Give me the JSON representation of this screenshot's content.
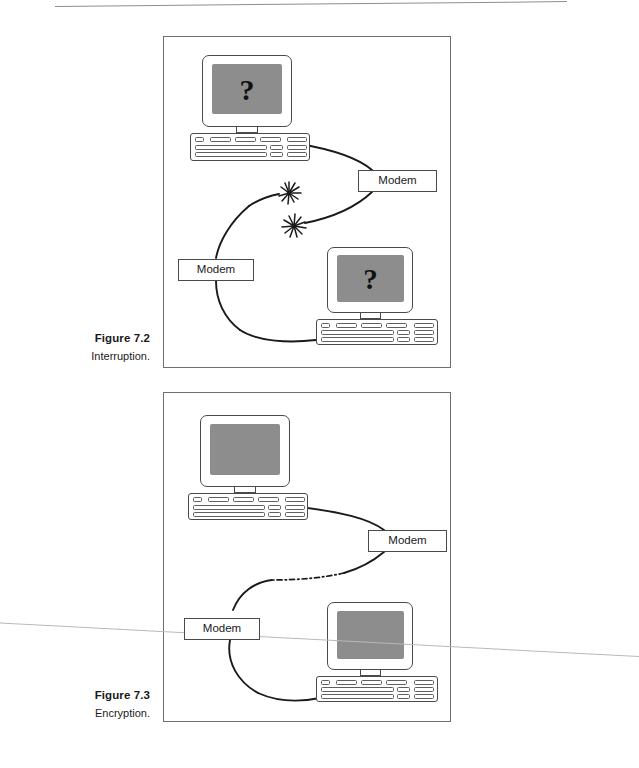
{
  "page": {
    "background_color": "#ffffff",
    "rule_color": "#8e8e8e",
    "artifact_line_color": "#b9b9b9"
  },
  "figures": [
    {
      "id": "figure-7-2",
      "caption_title": "Figure 7.2",
      "caption_subtitle": "Interruption.",
      "frame_border_color": "#6f6f6f",
      "computers": [
        {
          "position": "top-left",
          "screen_color": "#8d8d8d",
          "screen_symbol": "?"
        },
        {
          "position": "bottom-right",
          "screen_color": "#8d8d8d",
          "screen_symbol": "?"
        }
      ],
      "modems": [
        {
          "label": "Modem",
          "position": "right"
        },
        {
          "label": "Modem",
          "position": "left"
        }
      ],
      "link": {
        "style": "solid-curve-broken",
        "interruption_markers": 2,
        "marker_icon": "starburst-icon"
      }
    },
    {
      "id": "figure-7-3",
      "caption_title": "Figure 7.3",
      "caption_subtitle": "Encryption.",
      "frame_border_color": "#6f6f6f",
      "computers": [
        {
          "position": "top-left",
          "screen_color": "#8d8d8d",
          "screen_symbol": ""
        },
        {
          "position": "bottom-right",
          "screen_color": "#8d8d8d",
          "screen_symbol": ""
        }
      ],
      "modems": [
        {
          "label": "Modem",
          "position": "right"
        },
        {
          "label": "Modem",
          "position": "left"
        }
      ],
      "link": {
        "style": "solid-curve-with-dash-dot-middle",
        "interruption_markers": 0,
        "marker_icon": ""
      }
    }
  ]
}
